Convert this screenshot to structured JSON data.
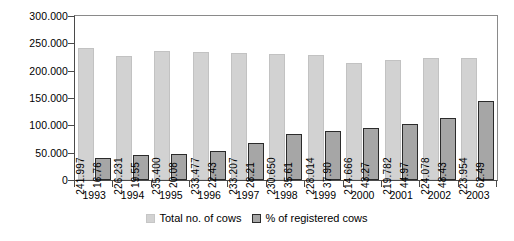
{
  "chart_data": {
    "type": "bar",
    "title": "",
    "subtitle": "",
    "xlabel": "",
    "ylabel": "",
    "categories": [
      "1993",
      "1994",
      "1995",
      "1996",
      "1997",
      "1998",
      "1999",
      "2000",
      "2001",
      "2002",
      "2003"
    ],
    "ylim": [
      0,
      300000
    ],
    "yticks": [
      0,
      50000,
      100000,
      150000,
      200000,
      250000,
      300000
    ],
    "ytick_labels": [
      "0",
      "50.000",
      "100.000",
      "150.000",
      "200.000",
      "250.000",
      "300.000"
    ],
    "grid": false,
    "legend_position": "bottom",
    "number_format": "european-dot-thousands",
    "series": [
      {
        "name": "Total no. of cows",
        "color": "#d2d2d2",
        "border_color": "#c2c2c2",
        "axis": "primary",
        "values": [
          241997,
          226231,
          235400,
          233477,
          233207,
          230650,
          228014,
          214666,
          219782,
          224078,
          223954
        ],
        "labels": [
          "241.997",
          "226.231",
          "235.400",
          "233.477",
          "233.207",
          "230.650",
          "228.014",
          "214.666",
          "219.782",
          "224.078",
          "223.954"
        ]
      },
      {
        "name": "% of registered cows",
        "color": "#a6a6a6",
        "border_color": "#2b2b2b",
        "axis": "secondary-scaled",
        "values": [
          16.76,
          19.55,
          20.08,
          22.43,
          28.21,
          35.61,
          37.9,
          43.27,
          44.97,
          48.43,
          62.49
        ],
        "labels": [
          "16.76",
          "19.55",
          "20.08",
          "22.43",
          "28.21",
          "35.61",
          "37.90",
          "43.27",
          "44.97",
          "48.43",
          "62.49"
        ],
        "plotted_heights": [
          41000,
          45000,
          48000,
          53000,
          67000,
          84000,
          89000,
          96000,
          103000,
          113000,
          145000
        ]
      }
    ]
  }
}
